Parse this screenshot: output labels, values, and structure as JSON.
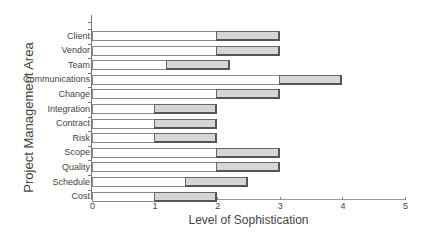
{
  "chart_data": {
    "type": "bar",
    "orientation": "horizontal",
    "stacked_range": true,
    "title": "",
    "xlabel": "Level of Sophistication",
    "ylabel": "Project Management Area",
    "xlim": [
      0,
      5
    ],
    "xticks": [
      "0",
      "1",
      "2",
      "3",
      "4",
      "5"
    ],
    "grid": false,
    "legend": null,
    "categories": [
      "Client",
      "Vendor",
      "Team",
      "Communications",
      "Change",
      "Integration",
      "Contract",
      "Risk",
      "Scope",
      "Quality",
      "Schedule",
      "Cost"
    ],
    "series": [
      {
        "name": "Current level (white bar, from 0)",
        "values": [
          2,
          2,
          1.2,
          3,
          2,
          1,
          1,
          1,
          2,
          2,
          1.5,
          1
        ]
      },
      {
        "name": "Target level (gray bar end)",
        "values": [
          3,
          3,
          2.2,
          4,
          3,
          2,
          2,
          2,
          3,
          3,
          2.5,
          2
        ]
      }
    ],
    "colors": {
      "current": "#ffffff",
      "gap": "#d6d6d6",
      "border": "#666666"
    }
  },
  "labels": {
    "xlabel": "Level of Sophistication",
    "ylabel": "Project Management Area",
    "xticks": [
      "0",
      "1",
      "2",
      "3",
      "4",
      "5"
    ],
    "categories": [
      "Client",
      "Vendor",
      "Team",
      "Communications",
      "Change",
      "Integration",
      "Contract",
      "Risk",
      "Scope",
      "Quality",
      "Schedule",
      "Cost"
    ]
  }
}
